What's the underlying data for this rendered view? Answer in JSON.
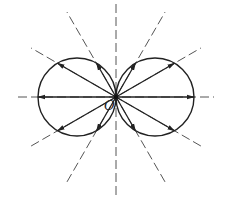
{
  "diagram": {
    "title": "",
    "origin_label": "O",
    "origin": [
      116,
      97
    ],
    "circle_radius": 39,
    "circles": [
      {
        "name": "left-lobe",
        "cx": 77,
        "cy": 97
      },
      {
        "name": "right-lobe",
        "cx": 155,
        "cy": 97
      }
    ],
    "ray_angles_deg": [
      0,
      30,
      60,
      120,
      150,
      180,
      210,
      240,
      300,
      330
    ],
    "dashed_line_angles_deg": [
      0,
      30,
      60,
      90,
      120,
      150
    ],
    "dashed_line_length": 98,
    "colors": {
      "stroke": "#222222",
      "dashed": "#555555",
      "background": "#ffffff"
    }
  }
}
